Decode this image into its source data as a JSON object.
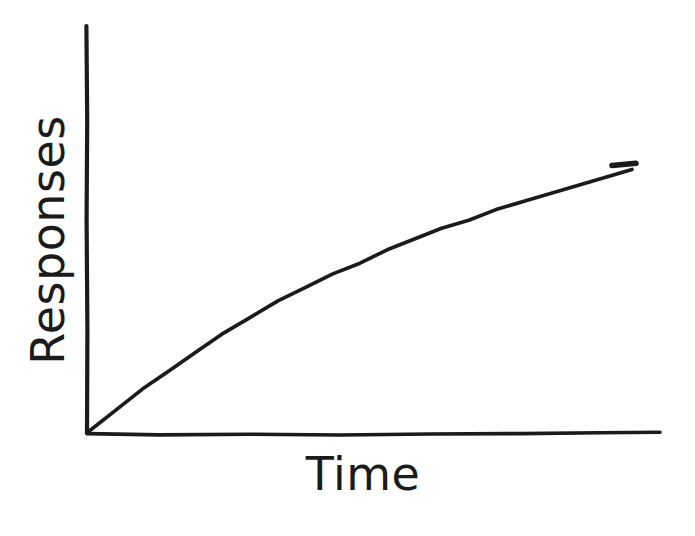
{
  "figure": {
    "background_color": "#ffffff",
    "ink_color": "#1b1b1b",
    "width": 695,
    "height": 536
  },
  "axes": {
    "y_axis_label": "Responses",
    "x_axis_label": "Time",
    "y_axis_icon": "vertical-axis-line",
    "x_axis_icon": "horizontal-axis-line",
    "origin_px": "87,433",
    "y_axis_top_px": "87,26",
    "x_axis_right_px": "660,432"
  },
  "chart_data": {
    "type": "line",
    "title": "",
    "subtitle": "",
    "xlabel": "Time",
    "ylabel": "Responses",
    "xlim": [
      0,
      100
    ],
    "ylim": [
      0,
      100
    ],
    "grid": false,
    "legend": false,
    "legend_position": "none",
    "tick_labels": {
      "x": [],
      "y": []
    },
    "annotations": [],
    "style": "hand-drawn negatively accelerated cumulative record",
    "series": [
      {
        "name": "Cumulative responses",
        "color": "#1b1b1b",
        "x": [
          0,
          5,
          10,
          15,
          20,
          25,
          30,
          35,
          40,
          45,
          50,
          55,
          60,
          65,
          70,
          75,
          80,
          85,
          90,
          95,
          100
        ],
        "y": [
          0,
          8,
          16,
          23,
          30,
          37,
          43,
          49,
          54,
          59,
          63,
          68,
          72,
          76,
          79,
          83,
          86,
          89,
          92,
          95,
          98
        ]
      }
    ]
  }
}
